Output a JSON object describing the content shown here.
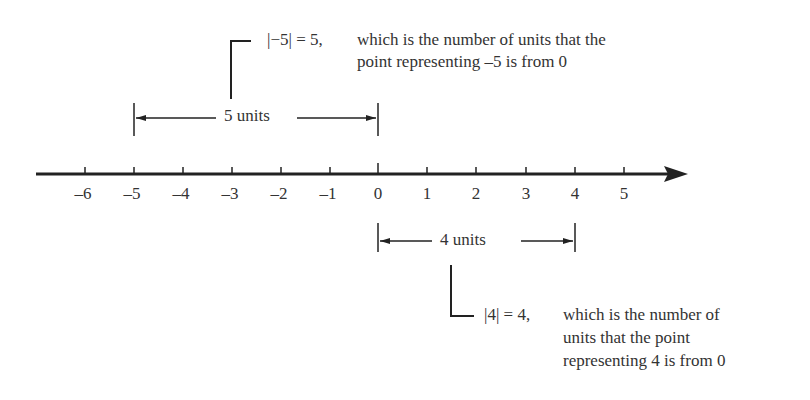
{
  "diagram": {
    "type": "number-line",
    "axis": {
      "min": -6,
      "max": 5,
      "tick_labels": [
        "–6",
        "–5",
        "–4",
        "–3",
        "–2",
        "–1",
        "0",
        "1",
        "2",
        "3",
        "4",
        "5"
      ]
    },
    "top_callout": {
      "expression": "|−5| = 5,",
      "line1": "which is the number of units that the",
      "line2": "point representing –5 is from 0"
    },
    "top_span": {
      "label": "5 units",
      "from": -5,
      "to": 0
    },
    "bottom_span": {
      "label": "4 units",
      "from": 0,
      "to": 4
    },
    "bottom_callout": {
      "expression": "|4| = 4,",
      "line1": "which is the number of",
      "line2": "units that the point",
      "line3": "representing 4 is from 0"
    },
    "colors": {
      "ink": "#222222",
      "background": "#ffffff"
    }
  }
}
